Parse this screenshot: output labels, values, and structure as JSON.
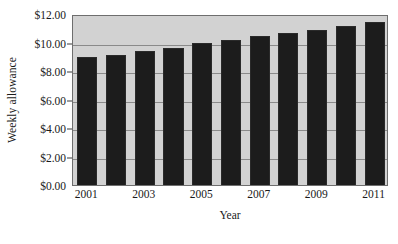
{
  "chart_data": {
    "type": "bar",
    "title": "",
    "xlabel": "Year",
    "ylabel": "Weekly allowance",
    "categories": [
      "2001",
      "2002",
      "2003",
      "2004",
      "2005",
      "2006",
      "2007",
      "2008",
      "2009",
      "2010",
      "2011"
    ],
    "values": [
      8.95,
      9.15,
      9.4,
      9.65,
      9.95,
      10.15,
      10.45,
      10.65,
      10.9,
      11.15,
      11.45
    ],
    "ylim": [
      0,
      12
    ],
    "ytick_values": [
      0,
      2,
      4,
      6,
      8,
      10,
      12
    ],
    "ytick_labels": [
      "$0.00",
      "$2.00",
      "$4.00",
      "$6.00",
      "$8.00",
      "$10.00",
      "$12.00"
    ],
    "xtick_labels": [
      "2001",
      "2003",
      "2005",
      "2007",
      "2009",
      "2011"
    ],
    "xtick_indices": [
      0,
      2,
      4,
      6,
      8,
      10
    ],
    "grid": true,
    "legend": false,
    "legend_position": "none",
    "bar_color": "#1c1c1c",
    "plot_background_color": "#d2d2d2",
    "gridline_color": "#8a8a8a",
    "axis_color": "#6e6e6e",
    "text_color": "#1a1a1a"
  }
}
